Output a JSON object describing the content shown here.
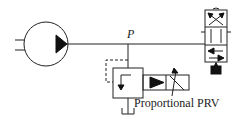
{
  "diagram": {
    "type": "hydraulic-schematic",
    "labels": {
      "pressure_node": "P",
      "relief_valve": "Proportional PRV"
    },
    "components": [
      {
        "id": "pump",
        "name": "Hydraulic pump",
        "symbol": "circle-with-triangle"
      },
      {
        "id": "prv",
        "name": "Proportional pressure relief valve",
        "symbol": "valve-box-with-solenoid"
      },
      {
        "id": "directional-valve",
        "name": "Directional control valve",
        "symbol": "multi-position-valve"
      }
    ],
    "colors": {
      "stroke": "#222222",
      "background": "#ffffff"
    }
  }
}
